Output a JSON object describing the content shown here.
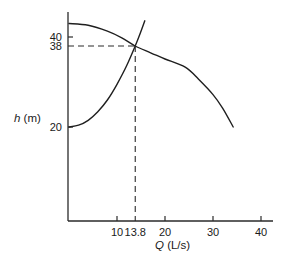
{
  "chart_data": {
    "type": "line",
    "title": "",
    "xlabel": "Q (L/s)",
    "xlabel_var": "Q",
    "xlabel_unit": " (L/s)",
    "ylabel": "h (m)",
    "ylabel_var": "h",
    "ylabel_unit": " (m)",
    "xlim": [
      0,
      42
    ],
    "ylim": [
      0,
      46
    ],
    "grid": false,
    "legend": null,
    "x_ticks": [
      {
        "value": 10,
        "label": "10"
      },
      {
        "value": 13.8,
        "label": "13.8"
      },
      {
        "value": 20,
        "label": "20"
      },
      {
        "value": 30,
        "label": "30"
      },
      {
        "value": 40,
        "label": "40"
      }
    ],
    "y_ticks": [
      {
        "value": 20,
        "label": "20"
      },
      {
        "value": 38,
        "label": "38"
      },
      {
        "value": 40,
        "label": "40"
      }
    ],
    "series": [
      {
        "name": "Pump curve",
        "points": [
          [
            0,
            43
          ],
          [
            4,
            42.6
          ],
          [
            8,
            41.3
          ],
          [
            11,
            39.8
          ],
          [
            13.8,
            38
          ],
          [
            17,
            36.5
          ],
          [
            20,
            35.1
          ],
          [
            24.2,
            33.3
          ],
          [
            27,
            30.6
          ],
          [
            30,
            27.2
          ],
          [
            32,
            24.2
          ],
          [
            34.2,
            20
          ]
        ]
      },
      {
        "name": "System curve",
        "points": [
          [
            0,
            20
          ],
          [
            2,
            20.4
          ],
          [
            4,
            21.5
          ],
          [
            6,
            23.4
          ],
          [
            8,
            26
          ],
          [
            10,
            29.5
          ],
          [
            12,
            33.6
          ],
          [
            13.8,
            38
          ],
          [
            15,
            41.3
          ],
          [
            15.8,
            43.6
          ]
        ]
      }
    ],
    "annotations": [
      {
        "type": "operating-point",
        "x": 13.8,
        "y": 38,
        "style": "dashed-guides-to-axes"
      }
    ]
  }
}
